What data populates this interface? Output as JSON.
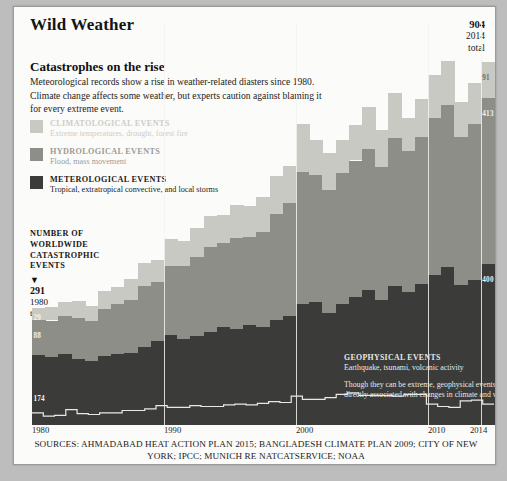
{
  "header": {
    "title": "Wild Weather",
    "corner_total": {
      "value": "904",
      "year": "2014",
      "label": "total"
    }
  },
  "subhead": "Catastrophes on the rise",
  "deck": "Meteorological records show a rise in weather-related diasters since 1980. Climate change affects some weather, but experts caution against blaming it for every extreme event.",
  "legend": [
    {
      "title": "CLIMATOLOGICAL EVENTS",
      "subtitle": "Extreme temperatures, drought, forest fire",
      "color": "#c9c9c4"
    },
    {
      "title": "HYDROLOGICAL EVENTS",
      "subtitle": "Flood, mass movement",
      "color": "#8e8e89"
    },
    {
      "title": "METEROLOGICAL EVENTS",
      "subtitle": "Tropical, extratropical convective, and local storms",
      "color": "#3b3b39"
    }
  ],
  "y_axis": {
    "caption": "NUMBER OF WORLDWIDE CATASTROPHIC EVENTS",
    "marker": "▼",
    "start_total": {
      "value": "291",
      "year": "1980",
      "label": "total"
    }
  },
  "geophysical_note": {
    "title": "GEOPHYSICAL EVENTS",
    "subtitle": "Earthquake, tsunami, volcanic activity",
    "body": "Though they can be extreme, geophysical events are not directly associated with changes in climate and weather."
  },
  "sources": "SOURCES: AHMADABAD HEAT ACTION PLAN 2015; BANGLADESH CLIMATE PLAN 2009; CITY OF NEW YORK; IPCC; MUNICH RE NATCATSERVICE; NOAA",
  "value_labels": {
    "clim_1980": "29",
    "hyd_1980": "88",
    "met_1980": "174",
    "clim_2014": "91",
    "hyd_2014": "413",
    "met_2014": "400"
  },
  "chart_data": {
    "type": "bar",
    "title": "Catastrophes on the rise",
    "xlabel": "",
    "ylabel": "NUMBER OF WORLDWIDE CATASTROPHIC EVENTS",
    "stacked": true,
    "grid": false,
    "legend_position": "left",
    "ylim": [
      0,
      1000
    ],
    "xlim": [
      1980,
      2014
    ],
    "tick_labels": [
      "1980",
      "1990",
      "2000",
      "2010",
      "2014"
    ],
    "ticks": [
      1980,
      1990,
      2000,
      2010,
      2014
    ],
    "x": [
      1980,
      1981,
      1982,
      1983,
      1984,
      1985,
      1986,
      1987,
      1988,
      1989,
      1990,
      1991,
      1992,
      1993,
      1994,
      1995,
      1996,
      1997,
      1998,
      1999,
      2000,
      2001,
      2002,
      2003,
      2004,
      2005,
      2006,
      2007,
      2008,
      2009,
      2010,
      2011,
      2012,
      2013,
      2014
    ],
    "series": [
      {
        "name": "METEROLOGICAL EVENTS",
        "color": "#3b3b39",
        "values": [
          174,
          168,
          176,
          163,
          158,
          171,
          176,
          178,
          195,
          209,
          223,
          215,
          222,
          231,
          244,
          238,
          250,
          243,
          262,
          271,
          300,
          305,
          278,
          300,
          318,
          335,
          312,
          345,
          330,
          350,
          372,
          392,
          348,
          360,
          400
        ]
      },
      {
        "name": "HYDROLOGICAL EVENTS",
        "color": "#8e8e89",
        "values": [
          88,
          92,
          96,
          104,
          100,
          118,
          126,
          134,
          150,
          146,
          172,
          181,
          196,
          212,
          208,
          226,
          218,
          236,
          262,
          282,
          330,
          318,
          306,
          328,
          340,
          352,
          330,
          368,
          352,
          366,
          392,
          404,
          368,
          390,
          413
        ]
      },
      {
        "name": "CLIMATOLOGICAL EVENTS",
        "color": "#c9c9c4",
        "values": [
          29,
          34,
          33,
          41,
          38,
          44,
          42,
          51,
          58,
          55,
          67,
          62,
          72,
          78,
          70,
          84,
          76,
          88,
          96,
          92,
          118,
          86,
          92,
          80,
          88,
          104,
          92,
          112,
          82,
          94,
          106,
          110,
          88,
          100,
          91
        ]
      }
    ],
    "geophysical_line": {
      "name": "GEOPHYSICAL EVENTS",
      "color": "#e9e9e4",
      "style": "step",
      "values": [
        30,
        22,
        24,
        38,
        28,
        26,
        30,
        30,
        36,
        36,
        40,
        48,
        44,
        44,
        48,
        46,
        46,
        50,
        52,
        50,
        54,
        58,
        56,
        72,
        64,
        64,
        68,
        76,
        80,
        74,
        74,
        74,
        72,
        76,
        76,
        52,
        46,
        44,
        60,
        62,
        52
      ]
    },
    "annotations": [
      {
        "text": "904 2014 total",
        "x": 2014,
        "y": 904
      },
      {
        "text": "291 1980 total",
        "x": 1980,
        "y": 291
      },
      {
        "text": "91",
        "x": 2014,
        "series": "CLIMATOLOGICAL EVENTS"
      },
      {
        "text": "413",
        "x": 2014,
        "series": "HYDROLOGICAL EVENTS"
      },
      {
        "text": "400",
        "x": 2014,
        "series": "METEROLOGICAL EVENTS"
      },
      {
        "text": "29",
        "x": 1980,
        "series": "CLIMATOLOGICAL EVENTS"
      },
      {
        "text": "88",
        "x": 1980,
        "series": "HYDROLOGICAL EVENTS"
      },
      {
        "text": "174",
        "x": 1980,
        "series": "METEROLOGICAL EVENTS"
      }
    ]
  }
}
